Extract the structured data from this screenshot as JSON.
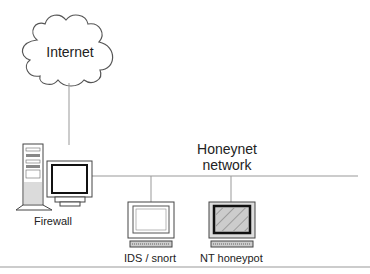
{
  "diagram": {
    "cloud": {
      "label": "Internet"
    },
    "network": {
      "label_line1": "Honeynet",
      "label_line2": "network"
    },
    "nodes": [
      {
        "id": "firewall",
        "label": "Firewall",
        "type": "tower-with-monitor"
      },
      {
        "id": "ids",
        "label": "IDS / snort",
        "type": "monitor-keyboard"
      },
      {
        "id": "nt-honeypot",
        "label": "NT honeypot",
        "type": "monitor-keyboard-hatched"
      }
    ],
    "colors": {
      "line": "#999999",
      "outline": "#444444",
      "screen_dark": "#222222"
    }
  }
}
